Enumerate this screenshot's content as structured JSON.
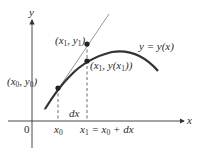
{
  "diagram": {
    "type": "tangent-line-approximation",
    "axes": {
      "x_label": "x",
      "y_label": "y",
      "origin_label": "0"
    },
    "curve_label": "y = y(x)",
    "points": [
      {
        "id": "p0",
        "label_main": "(x",
        "label_sub": "0",
        "label_mid": ", y",
        "label_sub2": "0",
        "label_end": ")"
      },
      {
        "id": "p1",
        "label_main": "(x",
        "label_sub": "1",
        "label_mid": ", y",
        "label_sub2": "1",
        "label_end": ")"
      },
      {
        "id": "p2",
        "label_main": "(x",
        "label_sub": "1",
        "label_mid": ", y(x",
        "label_sub2": "1",
        "label_end": "))"
      }
    ],
    "ticks": {
      "x0": {
        "main": "x",
        "sub": "0"
      },
      "x1": {
        "main": "x",
        "sub": "1",
        "rest_a": " = x",
        "sub2": "0",
        "rest_b": " + dx"
      }
    },
    "increment_label": "dx",
    "colors": {
      "stroke": "#333333",
      "tangent": "#8a8a8a",
      "point": "#222222"
    }
  }
}
